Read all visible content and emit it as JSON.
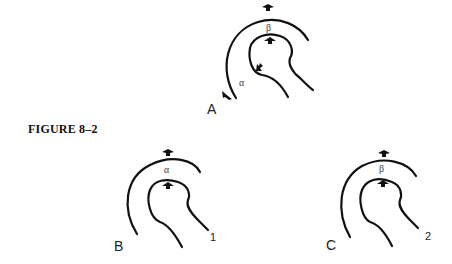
{
  "figure": {
    "caption": "FIGURE 8–2"
  },
  "panels": [
    {
      "id": "A",
      "label": "A",
      "angle_label": "α",
      "gap_label": "β",
      "number": ""
    },
    {
      "id": "B",
      "label": "B",
      "angle_label": "",
      "gap_label": "α",
      "number": "1"
    },
    {
      "id": "C",
      "label": "C",
      "angle_label": "",
      "gap_label": "β",
      "number": "2"
    }
  ],
  "colors": {
    "stroke": "#111111",
    "background": "#ffffff"
  }
}
